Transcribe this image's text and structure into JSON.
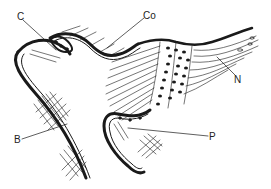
{
  "figure": {
    "type": "anatomical line drawing",
    "background": "#ffffff",
    "ink": "#1a1a1a"
  },
  "labels": [
    {
      "id": "C",
      "text": "C",
      "x": 17,
      "y": 12,
      "target": [
        56,
        50
      ]
    },
    {
      "id": "Co",
      "text": "Co",
      "x": 143,
      "y": 11,
      "target": [
        107,
        48
      ]
    },
    {
      "id": "N",
      "text": "N",
      "x": 234,
      "y": 75,
      "target": [
        217,
        57
      ]
    },
    {
      "id": "B",
      "text": "B",
      "x": 14,
      "y": 135,
      "target": [
        67,
        124
      ]
    },
    {
      "id": "P",
      "text": "P",
      "x": 209,
      "y": 132,
      "target": [
        128,
        128
      ]
    }
  ]
}
